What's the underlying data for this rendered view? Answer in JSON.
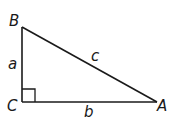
{
  "diagram": {
    "vertices": {
      "A": {
        "label": "A",
        "x": 157,
        "y": 102
      },
      "B": {
        "label": "B",
        "x": 22,
        "y": 27
      },
      "C": {
        "label": "C",
        "x": 22,
        "y": 102
      }
    },
    "sides": {
      "a": {
        "label": "a",
        "between": [
          "B",
          "C"
        ]
      },
      "b": {
        "label": "b",
        "between": [
          "C",
          "A"
        ]
      },
      "c": {
        "label": "c",
        "between": [
          "B",
          "A"
        ]
      }
    },
    "right_angle_at": "C",
    "stroke_color": "#1a1a1a"
  }
}
